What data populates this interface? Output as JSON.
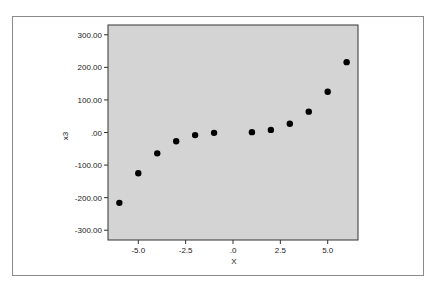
{
  "chart_data": {
    "type": "scatter",
    "title": "",
    "xlabel": "X",
    "ylabel": "x3",
    "xlim": [
      -6.6,
      6.6
    ],
    "ylim": [
      -330,
      330
    ],
    "grid": false,
    "legend": null,
    "x_ticks": [
      -5.0,
      -2.5,
      0.0,
      2.5,
      5.0
    ],
    "x_tick_labels": [
      "-5.0",
      "-2.5",
      ".0",
      "2.5",
      "5.0"
    ],
    "y_ticks": [
      300,
      200,
      100,
      0,
      -100,
      -200,
      -300
    ],
    "y_tick_labels": [
      "300.00",
      "200.00",
      "100.00",
      ".00",
      "-100.00",
      "-200.00",
      "-300.00"
    ],
    "x": [
      -6,
      -5,
      -4,
      -3,
      -2,
      -1,
      1,
      2,
      3,
      4,
      5,
      6
    ],
    "y": [
      -216,
      -125,
      -64,
      -27,
      -8,
      -1,
      1,
      8,
      27,
      64,
      125,
      216
    ],
    "colors": {
      "plot_background": "#d4d4d4",
      "marker": "#000000",
      "axis": "#333333"
    }
  }
}
